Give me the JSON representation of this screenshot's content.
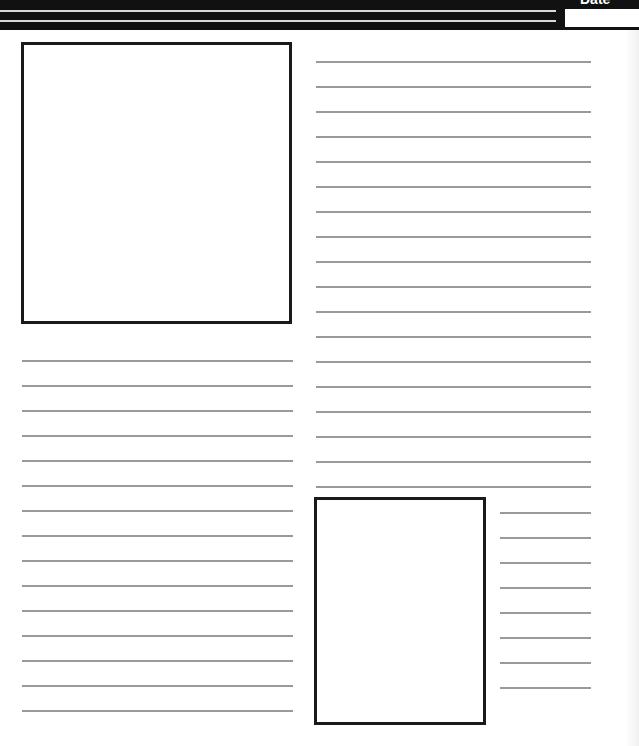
{
  "header": {
    "date_label": "Date",
    "date_value": "",
    "stripe_count": 2
  },
  "layout": {
    "top_left_image_box": {
      "x": 21,
      "y": 42,
      "width": 271,
      "height": 282
    },
    "bottom_image_box": {
      "x": 314,
      "y": 497,
      "width": 172,
      "height": 228
    },
    "left_lines": {
      "count": 15,
      "x": 22,
      "width": 271,
      "start_y": 360,
      "step": 25
    },
    "right_lines": {
      "count": 18,
      "x": 316,
      "width": 275,
      "start_y": 61,
      "step": 25
    },
    "short_lines": {
      "count": 8,
      "x": 500,
      "width": 91,
      "start_y": 512,
      "step": 25
    }
  },
  "colors": {
    "header": "#111111",
    "box_border": "#1a1a1a",
    "rule": "#9a9a9a",
    "background": "#ffffff"
  }
}
